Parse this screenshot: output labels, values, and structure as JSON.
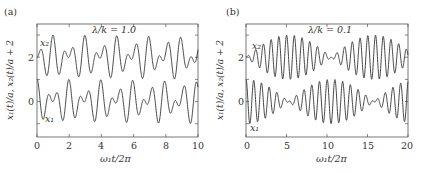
{
  "chart_data": [
    {
      "type": "line",
      "panel_label": "(a)",
      "annotation": "λ/k = 1.0",
      "xlabel": "ω₁t/2π",
      "ylabel": "x₁(t)/a, x₂(t)/a + 2",
      "xlim": [
        0,
        10
      ],
      "ylim": [
        -1.6,
        3.5
      ],
      "xticks": [
        "0",
        "2",
        "4",
        "6",
        "8",
        "10"
      ],
      "yticks": [
        "0",
        "2"
      ],
      "grid": false,
      "series": [
        {
          "name": "x₂",
          "offset": 2,
          "description": "beating oscillation, amplitude ~1, two close frequencies (strong coupling)"
        },
        {
          "name": "x₁",
          "offset": 0,
          "description": "beating oscillation, amplitude ~1, two close frequencies (strong coupling)"
        }
      ],
      "params": {
        "f1": 1.0,
        "f2": 1.52,
        "cycles_shown": 10
      }
    },
    {
      "type": "line",
      "panel_label": "(b)",
      "annotation": "λ/k = 0.1",
      "xlabel": "ω₁t/2π",
      "ylabel": "x₁(t)/a, x₂(t)/a + 2",
      "xlim": [
        0,
        20
      ],
      "ylim": [
        -1.6,
        3.5
      ],
      "xticks": [
        "0",
        "5",
        "10",
        "15",
        "20"
      ],
      "yticks": [
        "0",
        "2"
      ],
      "grid": false,
      "series": [
        {
          "name": "x₂",
          "offset": 2,
          "description": "slow energy exchange envelope, x₂ grows while x₁ decays"
        },
        {
          "name": "x₁",
          "offset": 0,
          "description": "slow energy exchange envelope, x₁ max at t=0"
        }
      ],
      "params": {
        "f1": 1.0,
        "f2": 1.095,
        "cycles_shown": 20
      }
    }
  ],
  "labels": {
    "a": {
      "panel": "(a)",
      "annotation": "λ/k = 1.0",
      "series_top": "x₂",
      "series_bottom": "x₁",
      "xlabel": "ω₁t/2π",
      "ylabel": "x₁(t)/a, x₂(t)/a + 2",
      "xticks": [
        "0",
        "2",
        "4",
        "6",
        "8",
        "10"
      ],
      "yticks": [
        "0",
        "2"
      ]
    },
    "b": {
      "panel": "(b)",
      "annotation": "λ/k = 0.1",
      "series_top": "x₂",
      "series_bottom": "x₁",
      "xlabel": "ω₁t/2π",
      "ylabel": "x₁(t)/a, x₂(t)/a + 2",
      "xticks": [
        "0",
        "5",
        "10",
        "15",
        "20"
      ],
      "yticks": [
        "0",
        "2"
      ]
    }
  },
  "style": {
    "line_color": "#333333",
    "frame_color": "#555555"
  }
}
